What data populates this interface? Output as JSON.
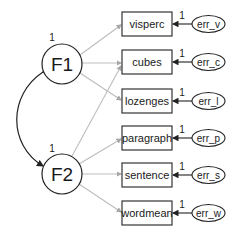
{
  "diagram": {
    "type": "structural-equation-model",
    "factors": [
      {
        "id": "F1",
        "label": "F1",
        "variance_label": "1",
        "cx": 62,
        "cy": 64
      },
      {
        "id": "F2",
        "label": "F2",
        "variance_label": "1",
        "cx": 62,
        "cy": 174
      }
    ],
    "indicators": [
      {
        "id": "visperc",
        "label": "visperc",
        "y": 12,
        "factor": "F1",
        "error": {
          "label": "err_v",
          "loading": "1"
        }
      },
      {
        "id": "cubes",
        "label": "cubes",
        "y": 50,
        "factor": "F1",
        "error": {
          "label": "err_c",
          "loading": "1"
        }
      },
      {
        "id": "lozenges",
        "label": "lozenges",
        "y": 89,
        "factor": "F1",
        "error": {
          "label": "err_l",
          "loading": "1"
        }
      },
      {
        "id": "paragraph",
        "label": "paragraph",
        "y": 126,
        "factor": "F2",
        "error": {
          "label": "err_p",
          "loading": "1"
        }
      },
      {
        "id": "sentence",
        "label": "sentence",
        "y": 163,
        "factor": "F2",
        "error": {
          "label": "err_s",
          "loading": "1"
        }
      },
      {
        "id": "wordmean",
        "label": "wordmean",
        "y": 201,
        "factor": "F2",
        "error": {
          "label": "err_w",
          "loading": "1"
        }
      }
    ],
    "cross_loading": {
      "from": "F2",
      "to": "cubes"
    },
    "covariance": {
      "between": [
        "F1",
        "F2"
      ]
    },
    "colors": {
      "path": "#b8b8b8",
      "stroke": "#222222",
      "covariance": "#222222"
    }
  }
}
